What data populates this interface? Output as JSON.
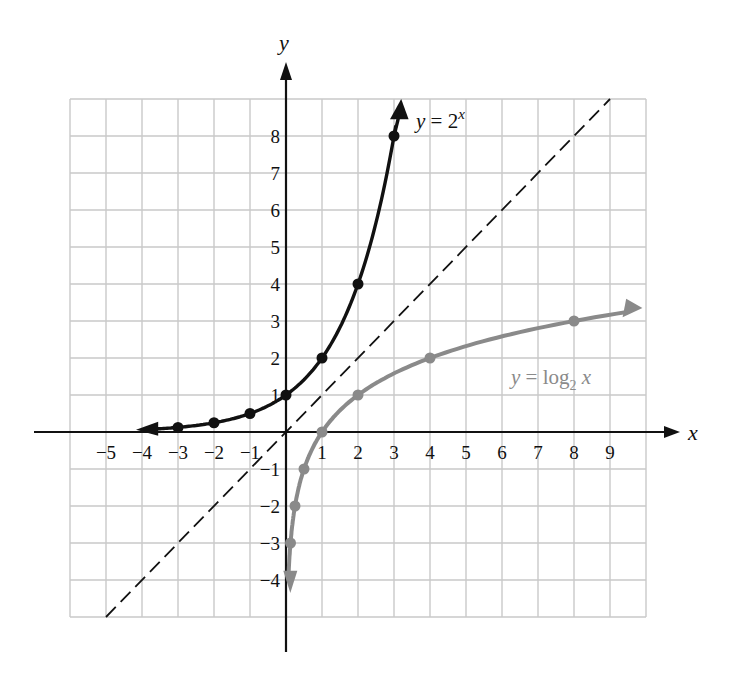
{
  "chart_data": {
    "type": "line",
    "title": "",
    "xlabel": "x",
    "ylabel": "y",
    "xlim": [
      -6,
      10
    ],
    "ylim": [
      -5,
      9
    ],
    "grid": true,
    "x_ticks": [
      -5,
      -4,
      -3,
      -2,
      -1,
      1,
      2,
      3,
      4,
      5,
      6,
      7,
      8,
      9
    ],
    "y_ticks": [
      -4,
      -3,
      -2,
      -1,
      1,
      2,
      3,
      4,
      5,
      6,
      7,
      8
    ],
    "x_tick_labels": [
      "−5",
      "−4",
      "−3",
      "−2",
      "−1",
      "1",
      "2",
      "3",
      "4",
      "5",
      "6",
      "7",
      "8",
      "9"
    ],
    "y_tick_labels": [
      "−4",
      "−3",
      "−2",
      "−1",
      "1",
      "2",
      "3",
      "4",
      "5",
      "6",
      "7",
      "8"
    ],
    "series": [
      {
        "name": "y = 2^x",
        "color": "#111111",
        "points": [
          [
            -3,
            0.125
          ],
          [
            -2,
            0.25
          ],
          [
            -1,
            0.5
          ],
          [
            0,
            1
          ],
          [
            1,
            2
          ],
          [
            2,
            4
          ],
          [
            3,
            8
          ]
        ],
        "arrow_left": true,
        "arrow_up": true
      },
      {
        "name": "y = log2 x",
        "color": "#8a8a8a",
        "points": [
          [
            0.125,
            -3
          ],
          [
            0.25,
            -2
          ],
          [
            0.5,
            -1
          ],
          [
            1,
            0
          ],
          [
            2,
            1
          ],
          [
            4,
            2
          ],
          [
            8,
            3
          ]
        ],
        "arrow_down": true,
        "arrow_right": true
      },
      {
        "name": "y = x",
        "style": "dashed",
        "color": "#111111",
        "points": [
          [
            -5,
            -5
          ],
          [
            9,
            9
          ]
        ]
      }
    ],
    "annotations": [
      {
        "text": "y = 2^x",
        "x": 3.6,
        "y": 8.6
      },
      {
        "text": "y = log2 x",
        "x": 6.2,
        "y": 1.5
      }
    ]
  },
  "labels": {
    "x_axis": "x",
    "y_axis": "y",
    "exp_label_y": "y",
    "exp_label_eq": " = 2",
    "exp_label_sup": "x",
    "log_label_y": "y",
    "log_label_eq": " = log",
    "log_label_sub": "2",
    "log_label_x": " x"
  }
}
